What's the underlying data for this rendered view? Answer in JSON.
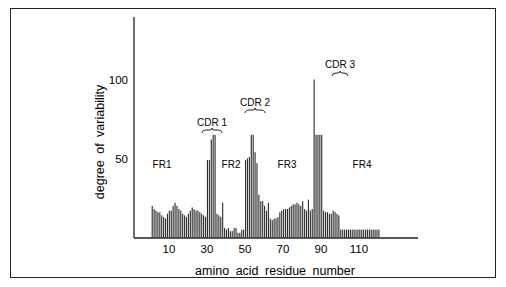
{
  "chart_data": {
    "type": "bar",
    "title": "",
    "xlabel": "amino acid residue number",
    "ylabel": "degree of variability",
    "ylim": [
      0,
      140
    ],
    "xlim": [
      0,
      140
    ],
    "grid": false,
    "legend": null,
    "x_ticks": [
      10,
      30,
      50,
      70,
      90,
      110
    ],
    "y_ticks": [
      50,
      100
    ],
    "annotations": [
      {
        "text": "FR1",
        "x": 14,
        "y": 47,
        "kind": "region"
      },
      {
        "text": "CDR 1",
        "x": 32,
        "y": 69,
        "kind": "hypervariable",
        "bracket": [
          30,
          35
        ]
      },
      {
        "text": "FR2",
        "x": 42,
        "y": 47,
        "kind": "region"
      },
      {
        "text": "CDR 2",
        "x": 55,
        "y": 83,
        "kind": "hypervariable",
        "bracket": [
          52,
          57
        ]
      },
      {
        "text": "FR3",
        "x": 75,
        "y": 47,
        "kind": "region"
      },
      {
        "text": "CDR 3",
        "x": 98,
        "y": 108,
        "kind": "hypervariable",
        "bracket": [
          96,
          100
        ]
      },
      {
        "text": "FR4",
        "x": 111,
        "y": 47,
        "kind": "region"
      }
    ],
    "x": [
      1,
      2,
      3,
      4,
      5,
      6,
      7,
      8,
      9,
      10,
      11,
      12,
      13,
      14,
      15,
      16,
      17,
      18,
      19,
      20,
      21,
      22,
      23,
      24,
      25,
      26,
      27,
      28,
      29,
      30,
      31,
      32,
      33,
      34,
      35,
      36,
      37,
      38,
      39,
      40,
      41,
      42,
      43,
      44,
      45,
      46,
      47,
      48,
      49,
      50,
      51,
      52,
      53,
      54,
      55,
      56,
      57,
      58,
      59,
      60,
      61,
      62,
      63,
      64,
      65,
      66,
      67,
      68,
      69,
      70,
      71,
      72,
      73,
      74,
      75,
      76,
      77,
      78,
      79,
      80,
      81,
      82,
      83,
      84,
      85,
      86,
      87,
      88,
      89,
      90,
      91,
      92,
      93,
      94,
      95,
      96,
      97,
      98,
      99,
      100,
      101,
      102,
      103,
      104,
      105,
      106,
      107,
      108,
      109,
      110,
      111,
      112,
      113,
      114,
      115,
      116,
      117,
      118,
      119,
      120
    ],
    "values": [
      20,
      18,
      17,
      16,
      16,
      14,
      13,
      12,
      15,
      17,
      17,
      20,
      22,
      20,
      18,
      17,
      15,
      14,
      13,
      15,
      17,
      19,
      18,
      17,
      17,
      16,
      15,
      14,
      13,
      49,
      49,
      62,
      65,
      65,
      15,
      14,
      13,
      22,
      6,
      5,
      6,
      4,
      4,
      6,
      6,
      3,
      3,
      5,
      5,
      49,
      50,
      51,
      65,
      65,
      54,
      47,
      27,
      23,
      23,
      20,
      17,
      22,
      12,
      11,
      12,
      12,
      13,
      16,
      17,
      18,
      18,
      18,
      19,
      20,
      21,
      21,
      22,
      21,
      20,
      23,
      18,
      17,
      24,
      17,
      18,
      100,
      65,
      65,
      65,
      65,
      17,
      16,
      16,
      15,
      15,
      17,
      16,
      15,
      14,
      5,
      5,
      5,
      5,
      5,
      5,
      5,
      5,
      5,
      5,
      5,
      5,
      5,
      5,
      5,
      5,
      5,
      5,
      5,
      5,
      5
    ]
  },
  "axes": {
    "y_label": "degree of variability",
    "x_label": "amino acid residue number",
    "y_tick_labels": [
      "100",
      "50"
    ],
    "x_tick_labels": [
      "10",
      "30",
      "50",
      "70",
      "90",
      "110"
    ]
  },
  "labels": {
    "fr1": "FR1",
    "fr2": "FR2",
    "fr3": "FR3",
    "fr4": "FR4",
    "cdr1": "CDR 1",
    "cdr2": "CDR 2",
    "cdr3": "CDR 3"
  }
}
